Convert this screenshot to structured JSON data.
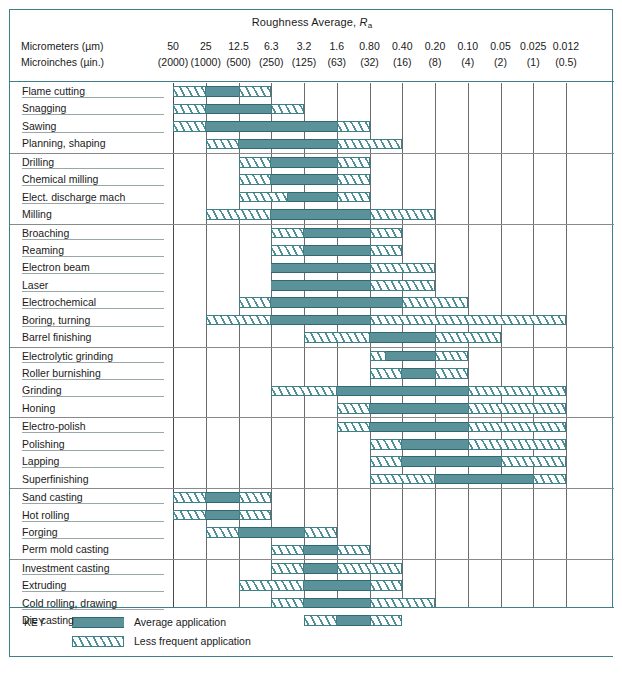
{
  "title": {
    "main": "Roughness Average,",
    "symbol": "R",
    "subscript": "a"
  },
  "axis": {
    "row1_label": "Micrometers (µm)",
    "row2_label": "Microinches (µin.)",
    "micrometers": [
      "50",
      "25",
      "12.5",
      "6.3",
      "3.2",
      "1.6",
      "0.80",
      "0.40",
      "0.20",
      "0.10",
      "0.05",
      "0.025",
      "0.012"
    ],
    "microinches": [
      "(2000)",
      "(1000)",
      "(500)",
      "(250)",
      "(125)",
      "(63)",
      "(32)",
      "(16)",
      "(8)",
      "(4)",
      "(2)",
      "(1)",
      "(0.5)"
    ]
  },
  "key": {
    "word": "KEY",
    "average_label": "Average application",
    "less_frequent_label": "Less frequent application"
  },
  "colors": {
    "teal_solid": "#5b929a",
    "teal_line": "#3f7f88",
    "grid": "#6b6b6b",
    "frame": "#3f7f88"
  },
  "chart_data": {
    "type": "bar",
    "title": "Roughness Average, Ra",
    "xlabel": "Roughness Average, Ra",
    "ylabel": "Process",
    "x_scale_micrometers": [
      50,
      25,
      12.5,
      6.3,
      3.2,
      1.6,
      0.8,
      0.4,
      0.2,
      0.1,
      0.05,
      0.025,
      0.012
    ],
    "x_scale_microinches": [
      2000,
      1000,
      500,
      250,
      125,
      63,
      32,
      16,
      8,
      4,
      2,
      1,
      0.5
    ],
    "note": "Each process row is a horizontal range bar. Column indices are 0-based cell slots between gridlines; slot i spans micrometer label i..i+1.",
    "legend": [
      {
        "name": "Average application",
        "style": "solid"
      },
      {
        "name": "Less frequent application",
        "style": "hatch"
      }
    ],
    "groups": [
      {
        "name": "group-1",
        "rows": [
          {
            "label": "Flame cutting",
            "less_left": [
              0,
              1
            ],
            "average": [
              1,
              2
            ],
            "less_right": [
              2,
              3
            ]
          },
          {
            "label": "Snagging",
            "less_left": [
              0,
              1
            ],
            "average": [
              1,
              3
            ],
            "less_right": [
              3,
              4
            ]
          },
          {
            "label": "Sawing",
            "less_left": [
              0,
              1
            ],
            "average": [
              1,
              5
            ],
            "less_right": [
              5,
              6
            ]
          },
          {
            "label": "Planning, shaping",
            "less_left": [
              1,
              2
            ],
            "average": [
              2,
              5
            ],
            "less_right": [
              5,
              7
            ]
          }
        ]
      },
      {
        "name": "group-2",
        "rows": [
          {
            "label": "Drilling",
            "less_left": [
              2,
              3
            ],
            "average": [
              3,
              5
            ],
            "less_right": [
              5,
              6
            ]
          },
          {
            "label": "Chemical milling",
            "less_left": [
              2,
              3
            ],
            "average": [
              3,
              5
            ],
            "less_right": [
              5,
              6
            ]
          },
          {
            "label": "Elect. discharge mach",
            "less_left": [
              2,
              3.5
            ],
            "average": [
              3.5,
              5
            ],
            "less_right": [
              5,
              6
            ]
          },
          {
            "label": "Milling",
            "less_left": [
              1,
              3
            ],
            "average": [
              3,
              6
            ],
            "less_right": [
              6,
              8
            ]
          }
        ]
      },
      {
        "name": "group-3",
        "rows": [
          {
            "label": "Broaching",
            "less_left": [
              3,
              4
            ],
            "average": [
              4,
              6
            ],
            "less_right": [
              6,
              7
            ]
          },
          {
            "label": "Reaming",
            "less_left": [
              3,
              4
            ],
            "average": [
              4,
              6
            ],
            "less_right": [
              6,
              7
            ]
          },
          {
            "label": "Electron beam",
            "less_left": null,
            "average": [
              3,
              6
            ],
            "less_right": [
              6,
              8
            ]
          },
          {
            "label": "Laser",
            "less_left": null,
            "average": [
              3,
              6
            ],
            "less_right": [
              6,
              8
            ]
          },
          {
            "label": "Electrochemical",
            "less_left": [
              2,
              3
            ],
            "average": [
              3,
              7
            ],
            "less_right": [
              7,
              9
            ]
          },
          {
            "label": "Boring, turning",
            "less_left": [
              1,
              3
            ],
            "average": [
              3,
              6
            ],
            "less_right": [
              6,
              12
            ]
          },
          {
            "label": "Barrel finishing",
            "less_left": [
              4,
              6
            ],
            "average": [
              6,
              8
            ],
            "less_right": [
              8,
              10
            ]
          }
        ]
      },
      {
        "name": "group-4",
        "rows": [
          {
            "label": "Electrolytic grinding",
            "less_left": [
              6,
              6.5
            ],
            "average": [
              6.5,
              8
            ],
            "less_right": [
              8,
              9
            ]
          },
          {
            "label": "Roller burnishing",
            "less_left": [
              6,
              7
            ],
            "average": [
              7,
              8
            ],
            "less_right": [
              8,
              9
            ]
          },
          {
            "label": "Grinding",
            "less_left": [
              3,
              5
            ],
            "average": [
              5,
              9
            ],
            "less_right": [
              9,
              12
            ]
          },
          {
            "label": "Honing",
            "less_left": [
              5,
              6
            ],
            "average": [
              6,
              9
            ],
            "less_right": [
              9,
              12
            ]
          }
        ]
      },
      {
        "name": "group-5",
        "rows": [
          {
            "label": "Electro-polish",
            "less_left": [
              5,
              6
            ],
            "average": [
              6,
              9
            ],
            "less_right": [
              9,
              12
            ]
          },
          {
            "label": "Polishing",
            "less_left": [
              6,
              7
            ],
            "average": [
              7,
              9
            ],
            "less_right": [
              9,
              12
            ]
          },
          {
            "label": "Lapping",
            "less_left": [
              6,
              7
            ],
            "average": [
              7,
              10
            ],
            "less_right": [
              10,
              12
            ]
          },
          {
            "label": "Superfinishing",
            "less_left": [
              6,
              8
            ],
            "average": [
              8,
              11
            ],
            "less_right": [
              11,
              12
            ]
          }
        ]
      },
      {
        "name": "group-6",
        "rows": [
          {
            "label": "Sand casting",
            "less_left": [
              0,
              1
            ],
            "average": [
              1,
              2
            ],
            "less_right": [
              2,
              3
            ]
          },
          {
            "label": "Hot rolling",
            "less_left": [
              0,
              1
            ],
            "average": [
              1,
              2
            ],
            "less_right": [
              2,
              3
            ]
          },
          {
            "label": "Forging",
            "less_left": [
              1,
              2
            ],
            "average": [
              2,
              4
            ],
            "less_right": [
              4,
              5
            ]
          },
          {
            "label": "Perm mold casting",
            "less_left": [
              3,
              4
            ],
            "average": [
              4,
              5
            ],
            "less_right": [
              5,
              6
            ]
          }
        ]
      },
      {
        "name": "group-7",
        "rows": [
          {
            "label": "Investment casting",
            "less_left": [
              3,
              4
            ],
            "average": [
              4,
              5
            ],
            "less_right": [
              5,
              7
            ]
          },
          {
            "label": "Extruding",
            "less_left": [
              2,
              4
            ],
            "average": [
              4,
              6
            ],
            "less_right": [
              6,
              7
            ]
          },
          {
            "label": "Cold rolling, drawing",
            "less_left": [
              3,
              4
            ],
            "average": [
              4,
              6
            ],
            "less_right": [
              6,
              8
            ]
          },
          {
            "label": "Die casting",
            "less_left": [
              4,
              5
            ],
            "average": [
              5,
              6
            ],
            "less_right": [
              6,
              7
            ]
          }
        ]
      }
    ]
  }
}
